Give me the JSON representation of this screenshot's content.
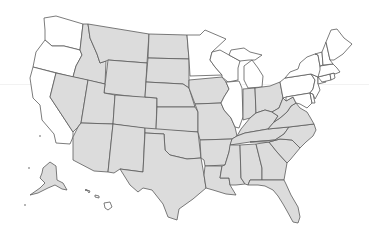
{
  "map": {
    "title": "",
    "region": "United States",
    "colors": {
      "shaded": "#dcdcdc",
      "unshaded": "#ffffff",
      "border": "#5a5a5a",
      "background": "#ffffff"
    },
    "shaded_states": [
      "AK",
      "MT",
      "ID",
      "WY",
      "NV",
      "UT",
      "AZ",
      "CO",
      "NM",
      "ND",
      "SD",
      "NE",
      "KS",
      "OK",
      "TX",
      "IA",
      "MO",
      "AR",
      "LA",
      "IN",
      "OH",
      "KY",
      "TN",
      "WV",
      "VA",
      "NC",
      "SC",
      "GA",
      "AL",
      "MS",
      "FL"
    ],
    "unshaded_states": [
      "WA",
      "OR",
      "CA",
      "MN",
      "WI",
      "MI",
      "IL",
      "NY",
      "PA",
      "NJ",
      "DE",
      "MD",
      "CT",
      "RI",
      "MA",
      "VT",
      "NH",
      "ME",
      "HI"
    ],
    "states": [
      {
        "code": "WA",
        "name": "Washington",
        "shaded": false,
        "d": "M44,18 L56,16 L83,24 L80,50 L64,46 L52,46 L45,40 L45,30 Z"
      },
      {
        "code": "OR",
        "name": "Oregon",
        "shaded": false,
        "d": "M45,40 L52,46 L64,46 L80,50 L82,55 L76,66 L73,77 L33,67 L36,52 Z"
      },
      {
        "code": "CA",
        "name": "California",
        "shaded": false,
        "d": "M33,67 L56,73 L50,97 L73,132 L73,137 L70,144 L56,143 L54,134 L42,120 L40,105 L33,98 L30,78 Z"
      },
      {
        "code": "ID",
        "name": "Idaho",
        "shaded": true,
        "d": "M83,24 L88,24 L90,38 L97,54 L100,63 L106,61 L105,84 L73,77 L76,66 L82,55 L80,50 Z"
      },
      {
        "code": "NV",
        "name": "Nevada",
        "shaded": true,
        "d": "M56,73 L88,80 L81,123 L78,127 L73,132 L50,97 Z"
      },
      {
        "code": "MT",
        "name": "Montana",
        "shaded": true,
        "d": "M88,24 L149,34 L147,63 L108,60 L106,61 L100,63 L97,54 L90,38 Z"
      },
      {
        "code": "WY",
        "name": "Wyoming",
        "shaded": true,
        "d": "M108,60 L147,63 L145,98 L104,93 Z"
      },
      {
        "code": "UT",
        "name": "Utah",
        "shaded": true,
        "d": "M88,80 L105,84 L104,93 L115,95 L113,124 L81,123 Z"
      },
      {
        "code": "AZ",
        "name": "Arizona",
        "shaded": true,
        "d": "M81,123 L113,124 L108,172 L94,171 L73,160 L73,137 L78,127 Z"
      },
      {
        "code": "CO",
        "name": "Colorado",
        "shaded": true,
        "d": "M115,95 L157,98 L156,130 L113,124 Z"
      },
      {
        "code": "NM",
        "name": "New Mexico",
        "shaded": true,
        "d": "M113,124 L145,128 L143,172 L120,169 L114,173 L108,172 Z"
      },
      {
        "code": "ND",
        "name": "North Dakota",
        "shaded": true,
        "d": "M149,34 L187,35 L189,59 L148,58 Z"
      },
      {
        "code": "SD",
        "name": "South Dakota",
        "shaded": true,
        "d": "M148,58 L189,59 L189,88 L183,84 L146,82 Z"
      },
      {
        "code": "NE",
        "name": "Nebraska",
        "shaded": true,
        "d": "M146,82 L183,84 L189,88 L195,107 L157,107 L157,98 L145,97 Z"
      },
      {
        "code": "KS",
        "name": "Kansas",
        "shaded": true,
        "d": "M157,107 L195,107 L198,112 L198,132 L156,130 Z"
      },
      {
        "code": "OK",
        "name": "Oklahoma",
        "shaded": true,
        "d": "M145,128 L198,132 L201,158 L187,159 L170,155 L165,150 L164,134 L145,133 Z"
      },
      {
        "code": "TX",
        "name": "Texas",
        "shaded": true,
        "d": "M145,133 L164,134 L165,150 L170,155 L187,159 L201,158 L204,175 L206,188 L193,199 L179,209 L177,220 L168,217 L163,204 L152,190 L143,188 L138,192 L130,185 L120,169 L143,172 Z"
      },
      {
        "code": "MN",
        "name": "Minnesota",
        "shaded": false,
        "d": "M187,35 L200,35 L205,30 L226,39 L212,52 L210,60 L215,67 L222,75 L190,76 L189,59 Z"
      },
      {
        "code": "IA",
        "name": "Iowa",
        "shaded": true,
        "d": "M189,80 L222,77 L226,82 L229,89 L224,97 L221,103 L195,104 L189,88 Z"
      },
      {
        "code": "MO",
        "name": "Missouri",
        "shaded": true,
        "d": "M195,104 L221,103 L224,110 L231,118 L235,127 L237,136 L232,139 L200,140 L198,132 L198,112 Z"
      },
      {
        "code": "AR",
        "name": "Arkansas",
        "shaded": true,
        "d": "M200,140 L232,139 L229,152 L225,165 L205,166 L204,160 L201,158 Z"
      },
      {
        "code": "LA",
        "name": "Louisiana",
        "shaded": true,
        "d": "M205,166 L222,166 L220,178 L229,178 L230,185 L236,195 L226,194 L213,190 L206,188 L204,175 Z"
      },
      {
        "code": "WI",
        "name": "Wisconsin",
        "shaded": false,
        "d": "M212,52 L220,50 L229,55 L240,61 L238,68 L238,80 L228,82 L222,77 L222,75 L215,67 L210,60 Z"
      },
      {
        "code": "IL",
        "name": "Illinois",
        "shaded": false,
        "d": "M228,82 L239,81 L242,88 L243,117 L239,128 L235,127 L231,118 L224,110 L221,103 L224,97 L229,89 L226,82 Z"
      },
      {
        "code": "MI",
        "name": "Michigan",
        "shaded": false,
        "d": "M231,50 L244,48 L250,52 L262,55 L255,60 L249,60 L240,61 L229,55 Z M244,66 L252,60 L258,68 L263,76 L262,87 L248,88 L244,80 Z"
      },
      {
        "code": "IN",
        "name": "Indiana",
        "shaded": true,
        "d": "M243,89 L255,88 L256,113 L250,118 L243,120 L243,117 Z"
      },
      {
        "code": "OH",
        "name": "Ohio",
        "shaded": true,
        "d": "M255,88 L262,87 L270,86 L280,82 L283,98 L279,108 L272,112 L265,110 L256,113 Z"
      },
      {
        "code": "KY",
        "name": "Kentucky",
        "shaded": true,
        "d": "M237,136 L241,129 L250,118 L256,113 L265,110 L272,112 L278,116 L274,122 L268,129 L245,133 Z"
      },
      {
        "code": "TN",
        "name": "Tennessee",
        "shaded": true,
        "d": "M232,139 L237,136 L245,133 L268,129 L278,128 L289,127 L284,134 L275,140 L250,142 L230,145 Z"
      },
      {
        "code": "MS",
        "name": "Mississippi",
        "shaded": true,
        "d": "M230,145 L240,145 L241,178 L245,184 L236,185 L230,185 L229,178 L220,178 L222,166 L225,165 L229,152 Z"
      },
      {
        "code": "AL",
        "name": "Alabama",
        "shaded": true,
        "d": "M240,145 L256,144 L262,168 L262,180 L250,180 L248,185 L245,184 L241,178 Z"
      },
      {
        "code": "GA",
        "name": "Georgia",
        "shaded": true,
        "d": "M256,144 L269,142 L277,152 L287,163 L284,180 L266,180 L262,180 L262,168 Z"
      },
      {
        "code": "FL",
        "name": "Florida",
        "shaded": true,
        "d": "M248,185 L250,180 L262,180 L266,180 L284,180 L286,184 L291,195 L298,207 L300,217 L298,223 L293,222 L287,211 L283,204 L278,196 L273,190 L265,186 L258,185 Z"
      },
      {
        "code": "SC",
        "name": "South Carolina",
        "shaded": true,
        "d": "M269,142 L280,139 L292,140 L300,148 L290,160 L287,163 L277,152 Z"
      },
      {
        "code": "NC",
        "name": "North Carolina",
        "shaded": true,
        "d": "M275,140 L284,134 L289,127 L314,124 L316,130 L313,136 L306,142 L300,148 L292,140 L280,139 L269,142 L250,142 Z"
      },
      {
        "code": "VA",
        "name": "Virginia",
        "shaded": true,
        "d": "M268,129 L274,122 L280,118 L287,112 L291,106 L296,103 L300,108 L307,112 L310,117 L314,124 L289,127 L278,128 Z"
      },
      {
        "code": "WV",
        "name": "West Virginia",
        "shaded": true,
        "d": "M272,112 L279,108 L283,98 L286,101 L293,97 L296,103 L291,106 L287,112 L280,118 L274,122 L278,116 Z"
      },
      {
        "code": "PA",
        "name": "Pennsylvania",
        "shaded": false,
        "d": "M280,82 L285,78 L311,74 L315,80 L313,89 L310,93 L286,97 L283,98 Z"
      },
      {
        "code": "MD",
        "name": "Maryland",
        "shaded": false,
        "d": "M286,97 L310,93 L312,103 L307,108 L300,104 L296,103 L293,97 L286,101 Z"
      },
      {
        "code": "DE",
        "name": "Delaware",
        "shaded": false,
        "d": "M310,93 L313,94 L315,103 L312,103 Z"
      },
      {
        "code": "NJ",
        "name": "New Jersey",
        "shaded": false,
        "d": "M311,74 L318,77 L318,84 L320,90 L315,99 L313,94 L310,93 L313,89 L315,80 Z"
      },
      {
        "code": "NY",
        "name": "New York",
        "shaded": false,
        "d": "M285,78 L290,72 L298,69 L300,63 L307,57 L315,54 L318,55 L320,66 L322,75 L326,82 L318,84 L318,77 L311,74 Z"
      },
      {
        "code": "CT",
        "name": "Connecticut",
        "shaded": false,
        "d": "M318,77 L330,74 L331,80 L322,82 Z"
      },
      {
        "code": "RI",
        "name": "Rhode Island",
        "shaded": false,
        "d": "M330,74 L334,73 L335,78 L331,80 Z"
      },
      {
        "code": "MA",
        "name": "Massachusetts",
        "shaded": false,
        "d": "M320,66 L333,64 L337,68 L340,72 L335,74 L334,73 L330,74 L318,77 L320,70 Z"
      },
      {
        "code": "VT",
        "name": "Vermont",
        "shaded": false,
        "d": "M315,54 L322,52 L323,65 L320,66 L318,55 Z"
      },
      {
        "code": "NH",
        "name": "New Hampshire",
        "shaded": false,
        "d": "M322,52 L326,42 L330,60 L333,64 L323,65 Z"
      },
      {
        "code": "ME",
        "name": "Maine",
        "shaded": false,
        "d": "M326,42 L331,30 L337,29 L344,38 L352,44 L343,54 L334,60 L330,60 Z"
      },
      {
        "code": "AK",
        "name": "Alaska",
        "shaded": true,
        "d": "M43,168 L50,162 L56,166 L57,180 L63,183 L67,190 L62,189 L55,185 L48,188 L38,193 L30,195 L40,188 L45,183 L40,178 L42,173 Z"
      },
      {
        "code": "HI",
        "name": "Hawaii",
        "shaded": false,
        "d": "M104,203 L110,202 L112,207 L108,210 L105,208 Z M95,195 L99,196 L99,198 L95,197 Z M87,190 L90,191 L89,193 Z"
      }
    ]
  }
}
